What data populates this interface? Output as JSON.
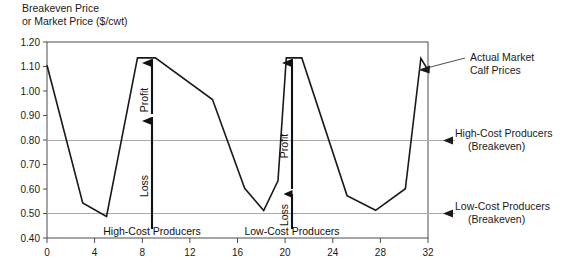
{
  "chart_data": {
    "type": "line",
    "title": "",
    "ylabel_line1": "Breakeven Price",
    "ylabel_line2": "or Market Price ($/cwt)",
    "xlabel": "",
    "xlim": [
      0,
      32
    ],
    "ylim": [
      0.4,
      1.2
    ],
    "grid": "horizontal-reference-lines-only",
    "legend": "none",
    "xticks": [
      0,
      4,
      8,
      12,
      16,
      20,
      24,
      28,
      32
    ],
    "xtick_labels": [
      "0",
      "4",
      "8",
      "12",
      "16",
      "20",
      "24",
      "28",
      "32"
    ],
    "yticks": [
      0.4,
      0.5,
      0.6,
      0.7,
      0.8,
      0.9,
      1.0,
      1.1,
      1.2
    ],
    "ytick_labels": [
      "0.40",
      "0.50",
      "0.60",
      "0.70",
      "0.80",
      "0.90",
      "1.00",
      "1.10",
      "1.20"
    ],
    "series": [
      {
        "name": "Actual Market Calf Prices",
        "color": "#1a1a1a",
        "x": [
          0,
          3,
          5,
          7.6,
          9.1,
          13.9,
          16.6,
          18.2,
          19.4,
          20.1,
          21.4,
          25.2,
          27.6,
          30.1,
          31.4,
          32.0
        ],
        "y": [
          1.105,
          0.543,
          0.488,
          1.135,
          1.135,
          0.965,
          0.603,
          0.512,
          0.633,
          1.135,
          1.135,
          0.573,
          0.513,
          0.601,
          1.133,
          1.085
        ]
      }
    ],
    "reference_lines": [
      {
        "name": "high-cost-breakeven",
        "value": 0.9,
        "label_line1": "High-Cost Producers",
        "label_line2": "(Breakeven)",
        "color": "#9a9a9a"
      },
      {
        "name": "low-cost-breakeven",
        "value": 0.6,
        "label_line1": "Low-Cost Producers",
        "label_line2": "(Breakeven)",
        "color": "#9a9a9a"
      }
    ],
    "callouts": [
      {
        "name": "actual-market-calf-prices",
        "label_line1": "Actual Market",
        "label_line2": "Calf Prices",
        "points_to_x": 31.6,
        "points_to_y": 1.1
      }
    ],
    "annotations": [
      {
        "name": "high-cost-producers-group",
        "label": "High-Cost Producers",
        "at_x": 8.0
      },
      {
        "name": "low-cost-producers-group",
        "label": "Low-Cost Producers",
        "at_x": 20.6
      },
      {
        "name": "profit-arrow-high-cost",
        "label": "Profit",
        "at_x": 8.0,
        "from_y": 0.9,
        "to_y": 1.135
      },
      {
        "name": "loss-arrow-high-cost",
        "label": "Loss",
        "at_x": 8.0,
        "from_y": 0.425,
        "to_y": 0.9
      },
      {
        "name": "profit-arrow-low-cost",
        "label": "Profit",
        "at_x": 20.6,
        "from_y": 0.6,
        "to_y": 1.135
      },
      {
        "name": "loss-arrow-low-cost",
        "label": "Loss",
        "at_x": 20.6,
        "from_y": 0.425,
        "to_y": 0.6
      }
    ]
  }
}
